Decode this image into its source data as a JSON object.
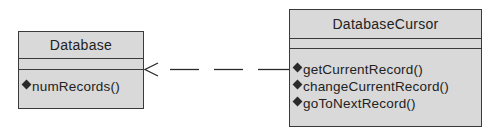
{
  "diagram": {
    "type": "UML class diagram",
    "classes": [
      {
        "id": "database",
        "name": "Database",
        "attributes": [],
        "operations": [
          "numRecords()"
        ]
      },
      {
        "id": "database-cursor",
        "name": "DatabaseCursor",
        "attributes": [],
        "operations": [
          "getCurrentRecord()",
          "changeCurrentRecord()",
          "goToNextRecord()"
        ]
      }
    ],
    "relationships": [
      {
        "type": "dependency",
        "from": "DatabaseCursor",
        "to": "Database",
        "style": "dashed",
        "arrowhead": "open"
      }
    ],
    "colors": {
      "class_fill": "#d9d9d9",
      "line": "#3a3a3a",
      "text": "#222222"
    }
  }
}
